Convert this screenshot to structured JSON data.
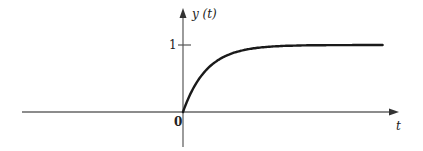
{
  "chart_data": {
    "type": "line",
    "title": "",
    "xlabel": "t",
    "ylabel": "y (t)",
    "y_tick_labels": [
      "1"
    ],
    "y_ticks": [
      1
    ],
    "origin_label": "0",
    "grid": false,
    "legend": null,
    "series": [
      {
        "name": "y(t)",
        "description": "first-order step response, y(t) = 1 - e^(-t/tau)",
        "x": [
          0,
          0.5,
          1,
          1.5,
          2,
          2.5,
          3,
          3.5,
          4,
          5,
          6,
          7,
          8
        ],
        "y": [
          0,
          0.39,
          0.63,
          0.78,
          0.86,
          0.92,
          0.95,
          0.97,
          0.98,
          0.99,
          1.0,
          1.0,
          1.0
        ]
      }
    ],
    "xlim": [
      -7.3,
      8.4
    ],
    "ylim": [
      -0.5,
      1.6
    ]
  },
  "labels": {
    "y_axis": "y (t)",
    "x_axis": "t",
    "origin": "0",
    "y_tick_one": "1"
  },
  "colors": {
    "axis": "#555555",
    "curve": "#1a1a1a",
    "text": "#222222"
  }
}
